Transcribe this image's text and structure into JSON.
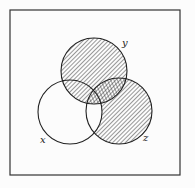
{
  "diagram": {
    "type": "venn",
    "frame": {
      "x": 10,
      "y": 10,
      "width": 170,
      "height": 165
    },
    "sets": [
      {
        "id": "x",
        "label": "x",
        "cx": 70,
        "cy": 112,
        "r": 32,
        "label_pos": [
          40,
          143
        ]
      },
      {
        "id": "y",
        "label": "y",
        "cx": 94,
        "cy": 71,
        "r": 33,
        "label_pos": [
          122,
          46
        ]
      },
      {
        "id": "z",
        "label": "z",
        "cx": 119,
        "cy": 111,
        "r": 33,
        "label_pos": [
          143,
          141
        ]
      }
    ],
    "shading": {
      "y_only": "cross-hatch",
      "y_and_z": "cross-hatch",
      "x_and_y_not_z": "single-hatch",
      "z_only": "single-hatch",
      "x_and_z_not_y": "none",
      "x_only": "none"
    },
    "colors": {
      "line": "#222222",
      "background": "#fcfcfc"
    }
  }
}
